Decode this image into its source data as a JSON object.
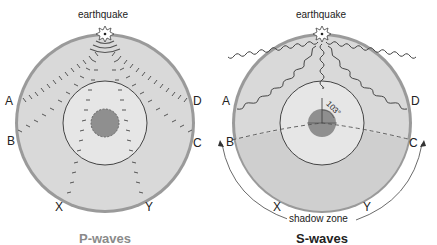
{
  "diagrams": [
    {
      "id": "p",
      "title": "P-waves",
      "title_color": "#8a8a8a",
      "source_label": "earthquake",
      "station_labels": {
        "A": "A",
        "B": "B",
        "C": "C",
        "D": "D",
        "X": "X",
        "Y": "Y"
      }
    },
    {
      "id": "s",
      "title": "S-waves",
      "title_color": "#222222",
      "source_label": "earthquake",
      "station_labels": {
        "A": "A",
        "B": "B",
        "C": "C",
        "D": "D",
        "X": "X",
        "Y": "Y"
      },
      "angle_label": "103°",
      "shadow_zone_label": "shadow zone"
    }
  ],
  "colors": {
    "mantle": "#d9d9d9",
    "crust": "#9a9a9a",
    "outer_core": "#e6e6e6",
    "inner_core": "#8f8f8f",
    "shadow_fill": "#cfcfcf",
    "line": "#444444"
  }
}
